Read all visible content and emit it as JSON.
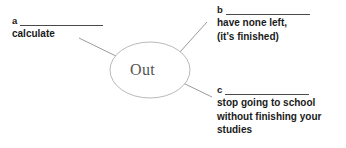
{
  "diagram": {
    "type": "word-web",
    "center": {
      "label": "Out",
      "shape": "ellipse",
      "stroke_color": "#b9b9b9",
      "text_color": "#555555"
    },
    "branches": [
      {
        "key": "a",
        "answer_blank": "",
        "text": "calculate"
      },
      {
        "key": "b",
        "answer_blank": "",
        "text": "have none left,\n(it's finished)"
      },
      {
        "key": "c",
        "answer_blank": "",
        "text": "stop going to school\nwithout finishing your\nstudies"
      }
    ]
  },
  "colors": {
    "background": "#ffffff",
    "text": "#1a1a1a",
    "rule": "#4a4a4a",
    "connector": "#9a9a9a"
  }
}
